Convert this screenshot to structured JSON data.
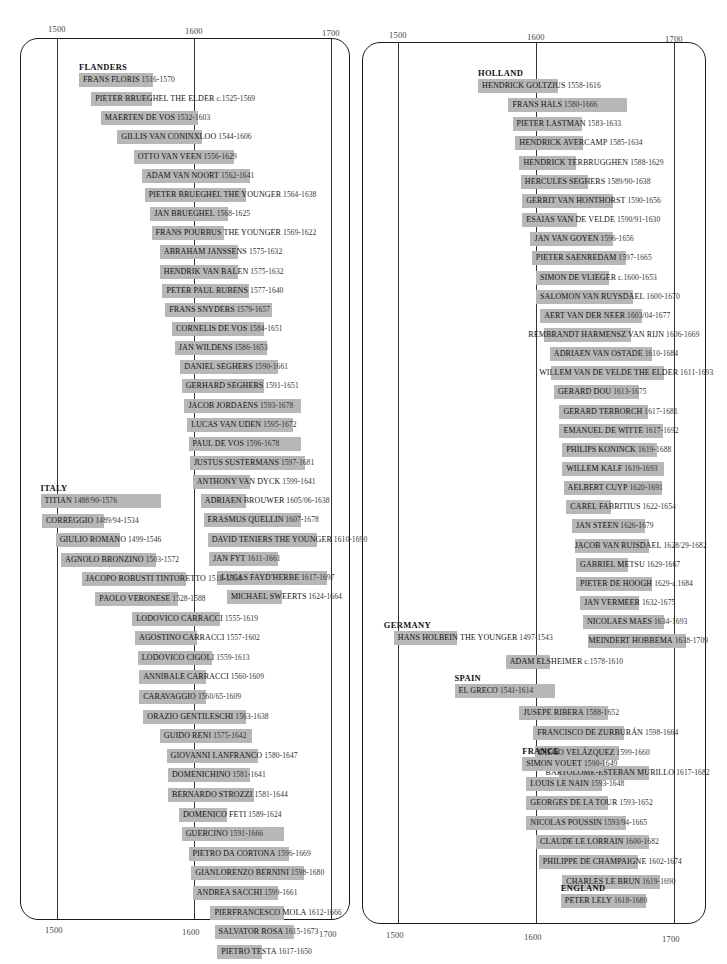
{
  "chart_data": {
    "type": "timeline",
    "title": "",
    "xlabel": "",
    "ylabel": "",
    "x_ticks": [
      "1500",
      "1600",
      "1700"
    ],
    "xlim": [
      1490,
      1720
    ],
    "grid": true,
    "panels": [
      {
        "id": "left",
        "groups": [
          {
            "name": "FLANDERS",
            "artists": [
              {
                "name": "FRANS FLORIS",
                "dates": "1516-1570",
                "start": 1516,
                "end": 1570
              },
              {
                "name": "PIETER BRUEGHEL THE ELDER",
                "dates": "c.1525-1569",
                "start": 1525,
                "end": 1569
              },
              {
                "name": "MAERTEN DE VOS",
                "dates": "1532-1603",
                "start": 1532,
                "end": 1603
              },
              {
                "name": "GILLIS VAN CONINXLOO",
                "dates": "1544-1606",
                "start": 1544,
                "end": 1606
              },
              {
                "name": "OTTO VAN VEEN",
                "dates": "1556-1629",
                "start": 1556,
                "end": 1629
              },
              {
                "name": "ADAM VAN NOORT",
                "dates": "1562-1641",
                "start": 1562,
                "end": 1641
              },
              {
                "name": "PIETER BRUEGHEL THE YOUNGER",
                "dates": "1564-1638",
                "start": 1564,
                "end": 1638
              },
              {
                "name": "JAN BRUEGHEL",
                "dates": "1568-1625",
                "start": 1568,
                "end": 1625
              },
              {
                "name": "FRANS POURBUS THE YOUNGER",
                "dates": "1569-1622",
                "start": 1569,
                "end": 1622
              },
              {
                "name": "ABRAHAM JANSSENS",
                "dates": "1575-1632",
                "start": 1575,
                "end": 1632
              },
              {
                "name": "HENDRIK VAN BALEN",
                "dates": "1575-1632",
                "start": 1575,
                "end": 1632
              },
              {
                "name": "PETER PAUL RUBENS",
                "dates": "1577-1640",
                "start": 1577,
                "end": 1640
              },
              {
                "name": "FRANS SNYDERS",
                "dates": "1579-1657",
                "start": 1579,
                "end": 1657
              },
              {
                "name": "CORNELIS DE VOS",
                "dates": "1584-1651",
                "start": 1584,
                "end": 1651
              },
              {
                "name": "JAN WILDENS",
                "dates": "1586-1653",
                "start": 1586,
                "end": 1653
              },
              {
                "name": "DANIEL SEGHERS",
                "dates": "1590-1661",
                "start": 1590,
                "end": 1661
              },
              {
                "name": "GERHARD SEGHERS",
                "dates": "1591-1651",
                "start": 1591,
                "end": 1651
              },
              {
                "name": "JACOB JORDAENS",
                "dates": "1593-1678",
                "start": 1593,
                "end": 1678
              },
              {
                "name": "LUCAS VAN UDEN",
                "dates": "1595-1672",
                "start": 1595,
                "end": 1672
              },
              {
                "name": "PAUL DE VOS",
                "dates": "1596-1678",
                "start": 1596,
                "end": 1678
              },
              {
                "name": "JUSTUS SUSTERMANS",
                "dates": "1597-1681",
                "start": 1597,
                "end": 1681
              },
              {
                "name": "ANTHONY VAN DYCK",
                "dates": "1599-1641",
                "start": 1599,
                "end": 1641
              },
              {
                "name": "ADRIAEN BROUWER",
                "dates": "1605/06-1638",
                "start": 1605,
                "end": 1638
              },
              {
                "name": "ERASMUS QUELLIN",
                "dates": "1607-1678",
                "start": 1607,
                "end": 1678
              },
              {
                "name": "DAVID TENIERS THE YOUNGER",
                "dates": "1610-1690",
                "start": 1610,
                "end": 1690
              },
              {
                "name": "JAN FYT",
                "dates": "1611-1661",
                "start": 1611,
                "end": 1661
              },
              {
                "name": "LUCAS FAYD'HERBE",
                "dates": "1617-1697",
                "start": 1617,
                "end": 1697
              },
              {
                "name": "MICHAEL SWEERTS",
                "dates": "1624-1664",
                "start": 1624,
                "end": 1664
              }
            ]
          },
          {
            "name": "ITALY",
            "artists": [
              {
                "name": "TITIAN",
                "dates": "1488/90-1576",
                "start": 1488,
                "end": 1576
              },
              {
                "name": "CORREGGIO",
                "dates": "1489/94-1534",
                "start": 1489,
                "end": 1534
              },
              {
                "name": "GIULIO ROMANO",
                "dates": "1499-1546",
                "start": 1499,
                "end": 1546
              },
              {
                "name": "AGNOLO BRONZINO",
                "dates": "1503-1572",
                "start": 1503,
                "end": 1572
              },
              {
                "name": "JACOPO ROBUSTI TINTORETTO",
                "dates": "1518-1594",
                "start": 1518,
                "end": 1594
              },
              {
                "name": "PAOLO VERONESE",
                "dates": "1528-1588",
                "start": 1528,
                "end": 1588
              },
              {
                "name": "LODOVICO CARRACCI",
                "dates": "1555-1619",
                "start": 1555,
                "end": 1619
              },
              {
                "name": "AGOSTINO CARRACCI",
                "dates": "1557-1602",
                "start": 1557,
                "end": 1602
              },
              {
                "name": "LODOVICO CIGOLI",
                "dates": "1559-1613",
                "start": 1559,
                "end": 1613
              },
              {
                "name": "ANNIBALE CARRACCI",
                "dates": "1560-1609",
                "start": 1560,
                "end": 1609
              },
              {
                "name": "CARAVAGGIO",
                "dates": "1560/65-1609",
                "start": 1560,
                "end": 1609
              },
              {
                "name": "ORAZIO GENTILESCHI",
                "dates": "1563-1638",
                "start": 1563,
                "end": 1638
              },
              {
                "name": "GUIDO RENI",
                "dates": "1575-1642",
                "start": 1575,
                "end": 1642
              },
              {
                "name": "GIOVANNI LANFRANCO",
                "dates": "1580-1647",
                "start": 1580,
                "end": 1647
              },
              {
                "name": "DOMENICHINO",
                "dates": "1581-1641",
                "start": 1581,
                "end": 1641
              },
              {
                "name": "BERNARDO STROZZI",
                "dates": "1581-1644",
                "start": 1581,
                "end": 1644
              },
              {
                "name": "DOMENICO FETI",
                "dates": "1589-1624",
                "start": 1589,
                "end": 1624
              },
              {
                "name": "GUERCINO",
                "dates": "1591-1666",
                "start": 1591,
                "end": 1666
              },
              {
                "name": "PIETRO DA CORTONA",
                "dates": "1596-1669",
                "start": 1596,
                "end": 1669
              },
              {
                "name": "GIANLORENZO BERNINI",
                "dates": "1598-1680",
                "start": 1598,
                "end": 1680
              },
              {
                "name": "ANDREA SACCHI",
                "dates": "1599-1661",
                "start": 1599,
                "end": 1661
              },
              {
                "name": "PIERFRANCESCO MOLA",
                "dates": "1612-1666",
                "start": 1612,
                "end": 1666
              },
              {
                "name": "SALVATOR ROSA",
                "dates": "1615-1673",
                "start": 1615,
                "end": 1673
              },
              {
                "name": "PIETRO TESTA",
                "dates": "1617-1650",
                "start": 1617,
                "end": 1650
              }
            ]
          }
        ]
      },
      {
        "id": "right",
        "groups": [
          {
            "name": "HOLLAND",
            "artists": [
              {
                "name": "HENDRICK GOLTZIUS",
                "dates": "1558-1616",
                "start": 1558,
                "end": 1616
              },
              {
                "name": "FRANS HALS",
                "dates": "1580-1666",
                "start": 1580,
                "end": 1666
              },
              {
                "name": "PIETER LASTMAN",
                "dates": "1583-1633",
                "start": 1583,
                "end": 1633
              },
              {
                "name": "HENDRICK AVERCAMP",
                "dates": "1585-1634",
                "start": 1585,
                "end": 1634
              },
              {
                "name": "HENDRICK TERBRUGGHEN",
                "dates": "1588-1629",
                "start": 1588,
                "end": 1629
              },
              {
                "name": "HERCULES SEGHERS",
                "dates": "1589/90-1638",
                "start": 1589,
                "end": 1638
              },
              {
                "name": "GERRIT VAN HONTHORST",
                "dates": "1590-1656",
                "start": 1590,
                "end": 1656
              },
              {
                "name": "ESAIAS VAN DE VELDE",
                "dates": "1590/91-1630",
                "start": 1590,
                "end": 1630
              },
              {
                "name": "JAN VAN GOYEN",
                "dates": "1596-1656",
                "start": 1596,
                "end": 1656
              },
              {
                "name": "PIETER SAENREDAM",
                "dates": "1597-1665",
                "start": 1597,
                "end": 1665
              },
              {
                "name": "SIMON DE VLIEGER",
                "dates": "c.1600-1653",
                "start": 1600,
                "end": 1653
              },
              {
                "name": "SALOMON VAN RUYSDAEL",
                "dates": "1600-1670",
                "start": 1600,
                "end": 1670
              },
              {
                "name": "AERT VAN DER NEER",
                "dates": "1603/04-1677",
                "start": 1603,
                "end": 1677
              },
              {
                "name": "REMBRANDT HARMENSZ VAN RIJN",
                "dates": "1606-1669",
                "start": 1606,
                "end": 1669
              },
              {
                "name": "ADRIAEN VAN OSTADE",
                "dates": "1610-1684",
                "start": 1610,
                "end": 1684
              },
              {
                "name": "WILLEM VAN DE VELDE THE ELDER",
                "dates": "1611-1693",
                "start": 1611,
                "end": 1693
              },
              {
                "name": "GERARD DOU",
                "dates": "1613-1675",
                "start": 1613,
                "end": 1675
              },
              {
                "name": "GERARD TERBORCH",
                "dates": "1617-1681",
                "start": 1617,
                "end": 1681
              },
              {
                "name": "EMANUEL DE WITTE",
                "dates": "1617-1692",
                "start": 1617,
                "end": 1692
              },
              {
                "name": "PHILIPS KONINCK",
                "dates": "1619-1688",
                "start": 1619,
                "end": 1688
              },
              {
                "name": "WILLEM KALF",
                "dates": "1619-1693",
                "start": 1619,
                "end": 1693
              },
              {
                "name": "AELBERT CUYP",
                "dates": "1620-1691",
                "start": 1620,
                "end": 1691
              },
              {
                "name": "CAREL FABRITIUS",
                "dates": "1622-1654",
                "start": 1622,
                "end": 1654
              },
              {
                "name": "JAN STEEN",
                "dates": "1626-1679",
                "start": 1626,
                "end": 1679
              },
              {
                "name": "JACOB VAN RUISDAEL",
                "dates": "1628/29-1682",
                "start": 1628,
                "end": 1682
              },
              {
                "name": "GABRIEL METSU",
                "dates": "1629-1667",
                "start": 1629,
                "end": 1667
              },
              {
                "name": "PIETER DE HOOGH",
                "dates": "1629-c.1684",
                "start": 1629,
                "end": 1684
              },
              {
                "name": "JAN VERMEER",
                "dates": "1632-1675",
                "start": 1632,
                "end": 1675
              },
              {
                "name": "NICOLAES MAES",
                "dates": "1634-1693",
                "start": 1634,
                "end": 1693
              },
              {
                "name": "MEINDERT HOBBEMA",
                "dates": "1638-1709",
                "start": 1638,
                "end": 1709
              }
            ]
          },
          {
            "name": "GERMANY",
            "artists": [
              {
                "name": "HANS HOLBEIN THE YOUNGER",
                "dates": "1497-1543",
                "start": 1497,
                "end": 1543
              },
              {
                "name": "ADAM ELSHEIMER",
                "dates": "c.1578-1610",
                "start": 1578,
                "end": 1610
              }
            ]
          },
          {
            "name": "SPAIN",
            "artists": [
              {
                "name": "EL GRECO",
                "dates": "1541-1614",
                "start": 1541,
                "end": 1614
              },
              {
                "name": "JUSEPE RIBERA",
                "dates": "1588-1652",
                "start": 1588,
                "end": 1652
              },
              {
                "name": "FRANCISCO DE ZURBURÁN",
                "dates": "1598-1664",
                "start": 1598,
                "end": 1664
              },
              {
                "name": "DIEGO VELÁZQUEZ",
                "dates": "1599-1660",
                "start": 1599,
                "end": 1660
              },
              {
                "name": "BARTOLOMÉ-ESTEBAN MURILLO",
                "dates": "1617-1682",
                "start": 1617,
                "end": 1682
              }
            ]
          },
          {
            "name": "FRANCE",
            "artists": [
              {
                "name": "SIMON VOUET",
                "dates": "1590-1649",
                "start": 1590,
                "end": 1649
              },
              {
                "name": "LOUIS LE NAIN",
                "dates": "1593-1648",
                "start": 1593,
                "end": 1648
              },
              {
                "name": "GEORGES DE LA TOUR",
                "dates": "1593-1652",
                "start": 1593,
                "end": 1652
              },
              {
                "name": "NICOLAS POUSSIN",
                "dates": "1593/94-1665",
                "start": 1593,
                "end": 1665
              },
              {
                "name": "CLAUDE LE LORRAIN",
                "dates": "1600-1682",
                "start": 1600,
                "end": 1682
              },
              {
                "name": "PHILIPPE DE CHAMPAIGNE",
                "dates": "1602-1674",
                "start": 1602,
                "end": 1674
              },
              {
                "name": "CHARLES LE BRUN",
                "dates": "1619-1690",
                "start": 1619,
                "end": 1690
              }
            ]
          },
          {
            "name": "ENGLAND",
            "artists": [
              {
                "name": "PETER LELY",
                "dates": "1618-1680",
                "start": 1618,
                "end": 1680
              }
            ]
          }
        ]
      }
    ]
  },
  "colors": {
    "bar": "#b7b7b7",
    "text": "#111111",
    "frame": "#1a1a1a",
    "gridline": "#333333"
  }
}
